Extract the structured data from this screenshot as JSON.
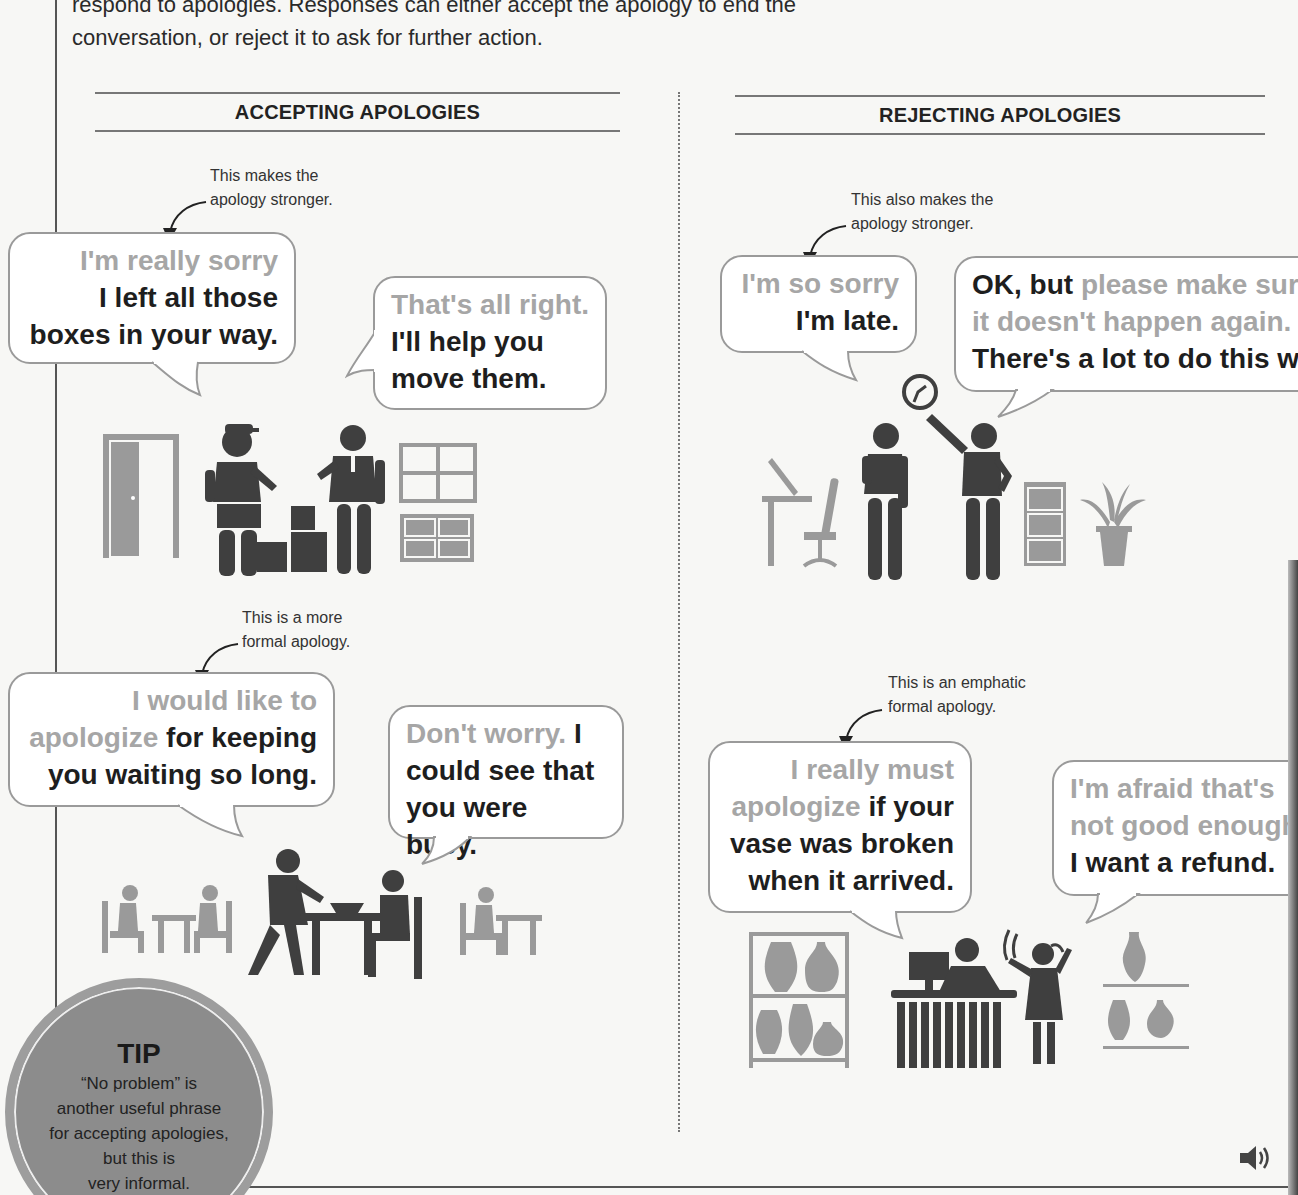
{
  "intro": {
    "line1": "respond to apologies. Responses can either accept the apology to end the",
    "line2": "conversation, or reject it to ask for further action."
  },
  "sections": {
    "accepting": {
      "title": "ACCEPTING APOLOGIES"
    },
    "rejecting": {
      "title": "REJECTING APOLOGIES"
    }
  },
  "dialogues": {
    "accept1": {
      "note": [
        "This makes the",
        "apology stronger."
      ],
      "apology": {
        "gray": "I'm really sorry",
        "dark1": "I left all those",
        "dark2": "boxes in your way."
      },
      "response": {
        "gray": "That's all right.",
        "dark1": "I'll help you",
        "dark2": "move them."
      },
      "scene": "delivery-worker-and-office-worker-with-boxes"
    },
    "accept2": {
      "note": [
        "This is a more",
        "formal apology."
      ],
      "apology": {
        "gray1": "I would like to",
        "gray2": "apologize",
        "dark2": " for keeping",
        "dark3": "you waiting so long."
      },
      "response": {
        "gray": "Don't worry.",
        "dark1": " I",
        "dark2": "could see that",
        "dark3": "you were busy."
      },
      "scene": "waiter-and-diner-in-restaurant"
    },
    "reject1": {
      "note": [
        "This also makes the",
        "apology stronger."
      ],
      "apology": {
        "gray": "I'm so sorry",
        "dark": "I'm late."
      },
      "response": {
        "dark1": "OK, but ",
        "gray1": "please make sur",
        "gray2": "it doesn't happen again.",
        "dark2": "There's a lot to do this we"
      },
      "scene": "late-employee-and-manager-pointing-at-clock"
    },
    "reject2": {
      "note": [
        "This is an emphatic",
        "formal apology."
      ],
      "apology": {
        "gray1": "I really must",
        "gray2": "apologize",
        "dark2": " if your",
        "dark3": "vase was broken",
        "dark4": "when it arrived."
      },
      "response": {
        "gray1": "I'm afraid that's",
        "gray2": "not good enough",
        "dark": "I want a refund."
      },
      "scene": "customer-complaining-at-shop-counter"
    }
  },
  "tip": {
    "title": "TIP",
    "lines": [
      "“No problem” is",
      "another useful phrase",
      "for accepting apologies,",
      "but this is",
      "very informal."
    ]
  },
  "audio": {
    "icon": "speaker-icon"
  },
  "colors": {
    "dark_figure": "#3f3f3f",
    "light_figure": "#9a9a9a",
    "gray_text": "#a6a6a6",
    "dark_text": "#1e1e1e",
    "tip_fill": "#8c8c8c"
  }
}
